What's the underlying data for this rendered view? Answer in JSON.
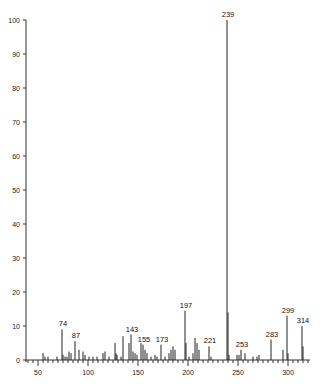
{
  "chart_data": {
    "type": "bar",
    "subtype": "mass-spectrum",
    "title": "",
    "xlabel": "",
    "ylabel": "",
    "xlim": [
      35,
      322
    ],
    "ylim": [
      0,
      100
    ],
    "grid": false,
    "legend": null,
    "x_ticks_major": [
      50,
      100,
      150,
      200,
      250,
      300
    ],
    "y_ticks": [
      0,
      10,
      20,
      30,
      40,
      50,
      60,
      70,
      80,
      90,
      100
    ],
    "peaks": [
      {
        "mz": 55,
        "intensity": 2
      },
      {
        "mz": 57,
        "intensity": 1
      },
      {
        "mz": 60,
        "intensity": 1
      },
      {
        "mz": 69,
        "intensity": 1
      },
      {
        "mz": 74,
        "intensity": 9,
        "label": "74"
      },
      {
        "mz": 75,
        "intensity": 1.5
      },
      {
        "mz": 77,
        "intensity": 1
      },
      {
        "mz": 79,
        "intensity": 1
      },
      {
        "mz": 81,
        "intensity": 2.5
      },
      {
        "mz": 83,
        "intensity": 2
      },
      {
        "mz": 87,
        "intensity": 5.5,
        "label": "87"
      },
      {
        "mz": 91,
        "intensity": 3
      },
      {
        "mz": 95,
        "intensity": 2.5
      },
      {
        "mz": 97,
        "intensity": 1.5
      },
      {
        "mz": 101,
        "intensity": 1
      },
      {
        "mz": 105,
        "intensity": 1
      },
      {
        "mz": 109,
        "intensity": 1
      },
      {
        "mz": 115,
        "intensity": 2
      },
      {
        "mz": 117,
        "intensity": 2.5
      },
      {
        "mz": 121,
        "intensity": 1
      },
      {
        "mz": 127,
        "intensity": 5
      },
      {
        "mz": 128,
        "intensity": 2
      },
      {
        "mz": 129,
        "intensity": 1.5
      },
      {
        "mz": 133,
        "intensity": 1
      },
      {
        "mz": 135,
        "intensity": 7
      },
      {
        "mz": 141,
        "intensity": 5
      },
      {
        "mz": 143,
        "intensity": 7.5,
        "label": "143"
      },
      {
        "mz": 145,
        "intensity": 2.5
      },
      {
        "mz": 147,
        "intensity": 2
      },
      {
        "mz": 149,
        "intensity": 1.5
      },
      {
        "mz": 153,
        "intensity": 5
      },
      {
        "mz": 155,
        "intensity": 4.5,
        "label": "155"
      },
      {
        "mz": 157,
        "intensity": 3
      },
      {
        "mz": 159,
        "intensity": 2
      },
      {
        "mz": 163,
        "intensity": 1
      },
      {
        "mz": 167,
        "intensity": 1.5
      },
      {
        "mz": 169,
        "intensity": 1
      },
      {
        "mz": 173,
        "intensity": 4.5,
        "label": "173"
      },
      {
        "mz": 177,
        "intensity": 1
      },
      {
        "mz": 181,
        "intensity": 2
      },
      {
        "mz": 183,
        "intensity": 3
      },
      {
        "mz": 185,
        "intensity": 4
      },
      {
        "mz": 187,
        "intensity": 3
      },
      {
        "mz": 197,
        "intensity": 14.5,
        "label": "197"
      },
      {
        "mz": 198,
        "intensity": 5
      },
      {
        "mz": 201,
        "intensity": 1
      },
      {
        "mz": 205,
        "intensity": 2
      },
      {
        "mz": 207,
        "intensity": 6.5
      },
      {
        "mz": 209,
        "intensity": 5
      },
      {
        "mz": 211,
        "intensity": 3
      },
      {
        "mz": 221,
        "intensity": 4,
        "label": "221"
      },
      {
        "mz": 223,
        "intensity": 1
      },
      {
        "mz": 239,
        "intensity": 100,
        "label": "239"
      },
      {
        "mz": 240,
        "intensity": 14
      },
      {
        "mz": 241,
        "intensity": 1.5
      },
      {
        "mz": 249,
        "intensity": 1.5
      },
      {
        "mz": 251,
        "intensity": 1.5
      },
      {
        "mz": 253,
        "intensity": 3,
        "label": "253"
      },
      {
        "mz": 257,
        "intensity": 2
      },
      {
        "mz": 265,
        "intensity": 1
      },
      {
        "mz": 269,
        "intensity": 1
      },
      {
        "mz": 271,
        "intensity": 1.5
      },
      {
        "mz": 283,
        "intensity": 6,
        "label": "283"
      },
      {
        "mz": 295,
        "intensity": 3
      },
      {
        "mz": 299,
        "intensity": 13,
        "label": "299"
      },
      {
        "mz": 300,
        "intensity": 2
      },
      {
        "mz": 314,
        "intensity": 10,
        "label": "314"
      },
      {
        "mz": 315,
        "intensity": 4
      }
    ]
  },
  "layout": {
    "x_origin_px": 38,
    "x_origin_mz": 50,
    "px_per_mz": 1.0,
    "baseline_px": 360,
    "top_px": 20,
    "y_axis_px": 26
  }
}
